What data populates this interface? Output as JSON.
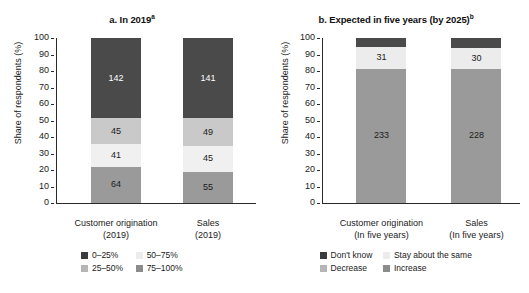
{
  "chart_data": [
    {
      "type": "bar",
      "id": "panel-a",
      "title": "a. In 2019",
      "title_superscript": "a",
      "stacked": true,
      "normalized": true,
      "xlabel": "",
      "ylabel": "Share of respondents (%)",
      "ylim": [
        0,
        100
      ],
      "yticks": [
        0,
        10,
        20,
        30,
        40,
        50,
        60,
        70,
        80,
        90,
        100
      ],
      "ytick_labels": [
        "0",
        "10",
        "20",
        "30",
        "40",
        "50",
        "60",
        "70",
        "80",
        "90",
        "100"
      ],
      "grid": false,
      "legend_position": "bottom",
      "categories": [
        "Customer origination (2019)",
        "Sales (2019)"
      ],
      "category_lines": [
        [
          "Customer origination",
          "(2019)"
        ],
        [
          "Sales",
          "(2019)"
        ]
      ],
      "series": [
        {
          "name": "0–25%",
          "color": "#3b3b3b",
          "values": [
            64,
            55
          ],
          "percents": [
            21.9,
            19.0
          ]
        },
        {
          "name": "25–50%",
          "color": "#f0f0f0",
          "values": [
            41,
            45
          ],
          "percents": [
            14.0,
            15.5
          ]
        },
        {
          "name": "50–75%",
          "color": "#c9c9c9",
          "values": [
            45,
            49
          ],
          "percents": [
            15.4,
            16.9
          ]
        },
        {
          "name": "75–100%",
          "color": "#9a9a9a",
          "values": [
            142,
            141
          ],
          "percents": [
            48.6,
            48.6
          ]
        }
      ],
      "stack_order_bottom_to_top": [
        "0–25%",
        "25–50%",
        "50–75%",
        "75–100%"
      ],
      "stack_colors_bottom_to_top": [
        "#9a9a9a",
        "#f0f0f0",
        "#c9c9c9",
        "#4a4a4a"
      ],
      "bars": [
        {
          "category": "Customer origination (2019)",
          "segments": [
            {
              "label": "64",
              "value": 64,
              "percent": 21.9,
              "color": "#9a9a9a",
              "text_color": "#1a1a1a",
              "legend": "0–25%"
            },
            {
              "label": "41",
              "value": 41,
              "percent": 14.0,
              "color": "#f0f0f0",
              "text_color": "#1a1a1a",
              "legend": "25–50%"
            },
            {
              "label": "45",
              "value": 45,
              "percent": 15.4,
              "color": "#c9c9c9",
              "text_color": "#1a1a1a",
              "legend": "50–75%"
            },
            {
              "label": "142",
              "value": 142,
              "percent": 48.7,
              "color": "#4a4a4a",
              "text_color": "#ffffff",
              "legend": "75–100%"
            }
          ],
          "total": 292
        },
        {
          "category": "Sales (2019)",
          "segments": [
            {
              "label": "55",
              "value": 55,
              "percent": 19.0,
              "color": "#9a9a9a",
              "text_color": "#1a1a1a",
              "legend": "0–25%"
            },
            {
              "label": "45",
              "value": 45,
              "percent": 15.5,
              "color": "#f0f0f0",
              "text_color": "#1a1a1a",
              "legend": "25–50%"
            },
            {
              "label": "49",
              "value": 49,
              "percent": 16.9,
              "color": "#c9c9c9",
              "text_color": "#1a1a1a",
              "legend": "50–75%"
            },
            {
              "label": "141",
              "value": 141,
              "percent": 48.6,
              "color": "#4a4a4a",
              "text_color": "#ffffff",
              "legend": "75–100%"
            }
          ],
          "total": 290
        }
      ],
      "legend": [
        {
          "label": "0–25%",
          "color": "#3b3b3b"
        },
        {
          "label": "50–75%",
          "color": "#ececec"
        },
        {
          "label": "25–50%",
          "color": "#b5b5b5"
        },
        {
          "label": "75–100%",
          "color": "#8c8c8c"
        }
      ]
    },
    {
      "type": "bar",
      "id": "panel-b",
      "title": "b. Expected in five years (by 2025)",
      "title_superscript": "b",
      "stacked": true,
      "normalized": true,
      "xlabel": "",
      "ylabel": "Share of respondents (%)",
      "ylim": [
        0,
        100
      ],
      "yticks": [
        0,
        10,
        20,
        30,
        40,
        50,
        60,
        70,
        80,
        90,
        100
      ],
      "ytick_labels": [
        "0",
        "10",
        "20",
        "30",
        "40",
        "50",
        "60",
        "70",
        "80",
        "90",
        "100"
      ],
      "grid": false,
      "legend_position": "bottom",
      "categories": [
        "Customer origination (In five years)",
        "Sales (In five years)"
      ],
      "category_lines": [
        [
          "Customer origination",
          "(In five years)"
        ],
        [
          "Sales",
          "(In five years)"
        ]
      ],
      "series": [
        {
          "name": "Don't know",
          "color": "#3b3b3b",
          "values": [
            null,
            null
          ],
          "percents": [
            4.0,
            5.0
          ]
        },
        {
          "name": "Stay about the same",
          "color": "#ececec",
          "values": [
            31,
            30
          ],
          "percents": [
            11.0,
            11.0
          ]
        },
        {
          "name": "Decrease",
          "color": "#b5b5b5",
          "values": [
            null,
            null
          ],
          "percents": [
            0,
            0
          ]
        },
        {
          "name": "Increase",
          "color": "#9a9a9a",
          "values": [
            233,
            228
          ],
          "percents": [
            82.0,
            81.5
          ]
        }
      ],
      "stack_order_bottom_to_top": [
        "Increase",
        "Stay about the same",
        "Don't know"
      ],
      "bars": [
        {
          "category": "Customer origination (In five years)",
          "segments": [
            {
              "label": "233",
              "value": 233,
              "percent": 81.5,
              "color": "#9a9a9a",
              "text_color": "#1a1a1a",
              "legend": "Increase"
            },
            {
              "label": "31",
              "value": 31,
              "percent": 13.0,
              "color": "#ececec",
              "text_color": "#1a1a1a",
              "legend": "Stay about the same"
            },
            {
              "label": "",
              "value": null,
              "percent": 5.5,
              "color": "#4a4a4a",
              "text_color": "#ffffff",
              "legend": "Don't know"
            }
          ]
        },
        {
          "category": "Sales (In five years)",
          "segments": [
            {
              "label": "228",
              "value": 228,
              "percent": 81.5,
              "color": "#9a9a9a",
              "text_color": "#1a1a1a",
              "legend": "Increase"
            },
            {
              "label": "30",
              "value": 30,
              "percent": 12.5,
              "color": "#ececec",
              "text_color": "#1a1a1a",
              "legend": "Stay about the same"
            },
            {
              "label": "",
              "value": null,
              "percent": 6.0,
              "color": "#4a4a4a",
              "text_color": "#ffffff",
              "legend": "Don't know"
            }
          ]
        }
      ],
      "legend": [
        {
          "label": "Don't know",
          "color": "#3b3b3b"
        },
        {
          "label": "Stay about the same",
          "color": "#ececec"
        },
        {
          "label": "Decrease",
          "color": "#b5b5b5"
        },
        {
          "label": "Increase",
          "color": "#8c8c8c"
        }
      ]
    }
  ]
}
